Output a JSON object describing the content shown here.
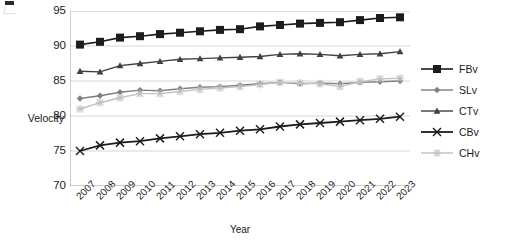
{
  "chart_data": {
    "type": "line",
    "title": "",
    "xlabel": "Year",
    "ylabel": "Velocity",
    "ylim": [
      70,
      95
    ],
    "yticks": [
      70,
      75,
      80,
      85,
      90,
      95
    ],
    "grid": true,
    "legend_position": "right",
    "categories": [
      "2007",
      "2008",
      "2009",
      "2010",
      "2011",
      "2012",
      "2013",
      "2014",
      "2015",
      "2016",
      "2017",
      "2018",
      "2019",
      "2020",
      "2021",
      "2022",
      "2023"
    ],
    "series": [
      {
        "name": "FBv",
        "marker": "square",
        "color": "#1c1c1c",
        "values": [
          90.2,
          90.6,
          91.2,
          91.4,
          91.7,
          91.9,
          92.1,
          92.3,
          92.4,
          92.8,
          93.0,
          93.2,
          93.3,
          93.4,
          93.7,
          94.0,
          94.1
        ]
      },
      {
        "name": "SLv",
        "marker": "diamond",
        "color": "#7f7f7f",
        "values": [
          82.5,
          82.9,
          83.4,
          83.7,
          83.6,
          83.9,
          84.1,
          84.2,
          84.4,
          84.6,
          84.8,
          84.6,
          84.7,
          84.6,
          84.8,
          84.9,
          85.0
        ]
      },
      {
        "name": "CTv",
        "marker": "triangle",
        "color": "#404040",
        "values": [
          86.4,
          86.3,
          87.2,
          87.5,
          87.8,
          88.1,
          88.2,
          88.3,
          88.4,
          88.5,
          88.8,
          88.9,
          88.8,
          88.6,
          88.8,
          88.9,
          89.2
        ]
      },
      {
        "name": "CBv",
        "marker": "x",
        "color": "#1c1c1c",
        "values": [
          75.0,
          75.8,
          76.2,
          76.4,
          76.8,
          77.1,
          77.4,
          77.6,
          77.9,
          78.1,
          78.5,
          78.8,
          79.0,
          79.2,
          79.4,
          79.6,
          79.9
        ]
      },
      {
        "name": "CHv",
        "marker": "cross",
        "color": "#c2c2c2",
        "values": [
          81.0,
          81.9,
          82.6,
          83.2,
          83.2,
          83.5,
          83.8,
          84.0,
          84.2,
          84.5,
          84.8,
          84.7,
          84.6,
          84.2,
          84.9,
          85.3,
          85.4
        ]
      }
    ]
  }
}
